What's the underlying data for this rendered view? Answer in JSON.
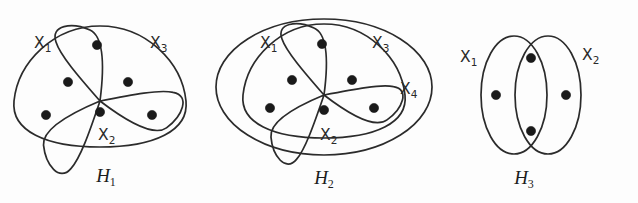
{
  "figure": {
    "background_color": "#fdfdfd",
    "ink_color": "#2b2b2b",
    "vertex_color": "#1a1a1a",
    "panels": [
      {
        "id": "H1",
        "caption": "H",
        "caption_sub": "1",
        "hyperedge_count": 3,
        "vertex_count": 6,
        "labels": [
          {
            "name": "X",
            "sub": "1",
            "x": 34,
            "y": 48
          },
          {
            "name": "X",
            "sub": "3",
            "x": 150,
            "y": 48
          },
          {
            "name": "X",
            "sub": "2",
            "x": 98,
            "y": 140
          }
        ],
        "vertices": [
          {
            "x": 97,
            "y": 45
          },
          {
            "x": 68,
            "y": 82
          },
          {
            "x": 128,
            "y": 82
          },
          {
            "x": 46,
            "y": 115
          },
          {
            "x": 100,
            "y": 112
          },
          {
            "x": 152,
            "y": 115
          }
        ],
        "caption_x": 106,
        "caption_y": 182
      },
      {
        "id": "H2",
        "caption": "H",
        "caption_sub": "2",
        "hyperedge_count": 4,
        "vertex_count": 6,
        "labels": [
          {
            "name": "X",
            "sub": "1",
            "x": 48,
            "y": 48
          },
          {
            "name": "X",
            "sub": "3",
            "x": 160,
            "y": 48
          },
          {
            "name": "X",
            "sub": "4",
            "x": 188,
            "y": 94
          },
          {
            "name": "X",
            "sub": "2",
            "x": 108,
            "y": 140
          }
        ],
        "vertices": [
          {
            "x": 110,
            "y": 44
          },
          {
            "x": 80,
            "y": 80
          },
          {
            "x": 140,
            "y": 80
          },
          {
            "x": 58,
            "y": 108
          },
          {
            "x": 112,
            "y": 110
          },
          {
            "x": 162,
            "y": 108
          }
        ],
        "caption_x": 112,
        "caption_y": 184
      },
      {
        "id": "H3",
        "caption": "H",
        "caption_sub": "3",
        "hyperedge_count": 2,
        "vertex_count": 4,
        "labels": [
          {
            "name": "X",
            "sub": "1",
            "x": 16,
            "y": 62
          },
          {
            "name": "X",
            "sub": "2",
            "x": 138,
            "y": 60
          }
        ],
        "vertices": [
          {
            "x": 52,
            "y": 95
          },
          {
            "x": 87,
            "y": 58
          },
          {
            "x": 87,
            "y": 131
          },
          {
            "x": 122,
            "y": 95
          }
        ],
        "caption_x": 80,
        "caption_y": 184
      }
    ]
  }
}
